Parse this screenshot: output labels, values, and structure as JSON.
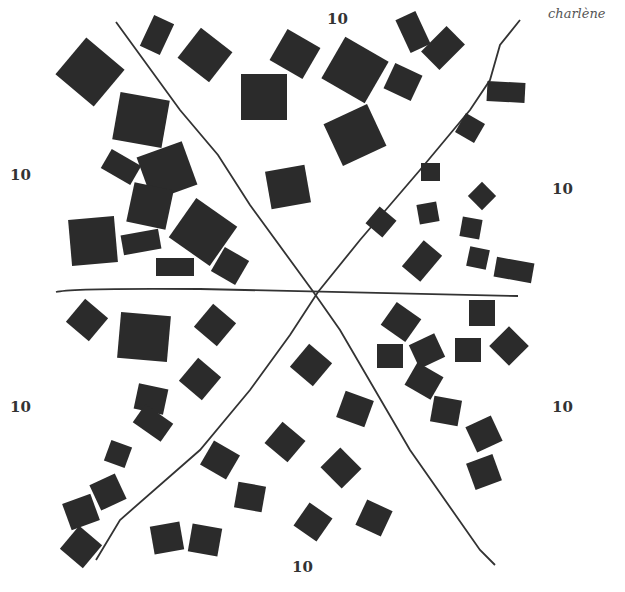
{
  "signature": "charlène",
  "labels": [
    {
      "text": "10",
      "x": 327,
      "y": 10,
      "sector": "top"
    },
    {
      "text": "10",
      "x": 10,
      "y": 166,
      "sector": "upper-left"
    },
    {
      "text": "10",
      "x": 552,
      "y": 180,
      "sector": "upper-right"
    },
    {
      "text": "10",
      "x": 10,
      "y": 398,
      "sector": "lower-left"
    },
    {
      "text": "10",
      "x": 552,
      "y": 398,
      "sector": "lower-right"
    },
    {
      "text": "10",
      "x": 292,
      "y": 558,
      "sector": "bottom"
    }
  ],
  "lines": [
    {
      "d": "M116 22 L180 110 L218 155 L250 205 L312 290 L340 330 L410 450 L480 550 L495 565"
    },
    {
      "d": "M520 20 L500 45 L490 80 L470 110 L420 170 L360 240 L318 292 L290 335 L250 390 L200 450 L120 520 L96 560"
    },
    {
      "d": "M56 292 Q70 288 200 289 L518 296"
    }
  ],
  "squares": [
    {
      "x": 65,
      "y": 48,
      "w": 50,
      "h": 48,
      "r": 40
    },
    {
      "x": 146,
      "y": 18,
      "w": 22,
      "h": 34,
      "r": 25
    },
    {
      "x": 185,
      "y": 36,
      "w": 40,
      "h": 38,
      "r": 38
    },
    {
      "x": 241,
      "y": 74,
      "w": 46,
      "h": 46,
      "r": 0
    },
    {
      "x": 276,
      "y": 36,
      "w": 38,
      "h": 36,
      "r": 30
    },
    {
      "x": 116,
      "y": 96,
      "w": 50,
      "h": 48,
      "r": 10
    },
    {
      "x": 104,
      "y": 156,
      "w": 34,
      "h": 22,
      "r": 30
    },
    {
      "x": 143,
      "y": 148,
      "w": 48,
      "h": 46,
      "r": -20
    },
    {
      "x": 130,
      "y": 186,
      "w": 40,
      "h": 40,
      "r": 12
    },
    {
      "x": 70,
      "y": 218,
      "w": 46,
      "h": 46,
      "r": -5
    },
    {
      "x": 122,
      "y": 232,
      "w": 38,
      "h": 20,
      "r": -10
    },
    {
      "x": 178,
      "y": 208,
      "w": 50,
      "h": 48,
      "r": 35
    },
    {
      "x": 156,
      "y": 258,
      "w": 38,
      "h": 18,
      "r": 0
    },
    {
      "x": 216,
      "y": 252,
      "w": 28,
      "h": 28,
      "r": 30
    },
    {
      "x": 268,
      "y": 168,
      "w": 40,
      "h": 38,
      "r": -10
    },
    {
      "x": 330,
      "y": 46,
      "w": 50,
      "h": 48,
      "r": 30
    },
    {
      "x": 331,
      "y": 112,
      "w": 48,
      "h": 46,
      "r": -25
    },
    {
      "x": 388,
      "y": 68,
      "w": 30,
      "h": 28,
      "r": 25
    },
    {
      "x": 402,
      "y": 14,
      "w": 22,
      "h": 36,
      "r": -25
    },
    {
      "x": 430,
      "y": 30,
      "w": 26,
      "h": 36,
      "r": 45
    },
    {
      "x": 487,
      "y": 82,
      "w": 38,
      "h": 20,
      "r": 3
    },
    {
      "x": 459,
      "y": 117,
      "w": 22,
      "h": 22,
      "r": 30
    },
    {
      "x": 421,
      "y": 163,
      "w": 19,
      "h": 18,
      "r": 0
    },
    {
      "x": 472,
      "y": 186,
      "w": 20,
      "h": 20,
      "r": 45
    },
    {
      "x": 370,
      "y": 211,
      "w": 22,
      "h": 22,
      "r": 40
    },
    {
      "x": 418,
      "y": 203,
      "w": 20,
      "h": 20,
      "r": -10
    },
    {
      "x": 461,
      "y": 218,
      "w": 20,
      "h": 20,
      "r": 10
    },
    {
      "x": 410,
      "y": 244,
      "w": 24,
      "h": 34,
      "r": 40
    },
    {
      "x": 468,
      "y": 248,
      "w": 20,
      "h": 20,
      "r": 12
    },
    {
      "x": 495,
      "y": 260,
      "w": 38,
      "h": 20,
      "r": 10
    },
    {
      "x": 72,
      "y": 305,
      "w": 30,
      "h": 30,
      "r": 40
    },
    {
      "x": 119,
      "y": 314,
      "w": 50,
      "h": 46,
      "r": 5
    },
    {
      "x": 200,
      "y": 310,
      "w": 30,
      "h": 30,
      "r": 40
    },
    {
      "x": 185,
      "y": 364,
      "w": 30,
      "h": 30,
      "r": 40
    },
    {
      "x": 136,
      "y": 386,
      "w": 30,
      "h": 26,
      "r": 12
    },
    {
      "x": 136,
      "y": 412,
      "w": 34,
      "h": 22,
      "r": 35
    },
    {
      "x": 107,
      "y": 443,
      "w": 22,
      "h": 22,
      "r": 20
    },
    {
      "x": 94,
      "y": 478,
      "w": 28,
      "h": 28,
      "r": -25
    },
    {
      "x": 66,
      "y": 498,
      "w": 30,
      "h": 28,
      "r": -20
    },
    {
      "x": 66,
      "y": 532,
      "w": 30,
      "h": 30,
      "r": 40
    },
    {
      "x": 152,
      "y": 524,
      "w": 30,
      "h": 28,
      "r": -10
    },
    {
      "x": 190,
      "y": 526,
      "w": 30,
      "h": 28,
      "r": 10
    },
    {
      "x": 236,
      "y": 484,
      "w": 28,
      "h": 26,
      "r": 10
    },
    {
      "x": 205,
      "y": 446,
      "w": 30,
      "h": 28,
      "r": 30
    },
    {
      "x": 270,
      "y": 428,
      "w": 30,
      "h": 28,
      "r": 40
    },
    {
      "x": 296,
      "y": 350,
      "w": 30,
      "h": 30,
      "r": 40
    },
    {
      "x": 340,
      "y": 395,
      "w": 30,
      "h": 28,
      "r": 20
    },
    {
      "x": 326,
      "y": 454,
      "w": 30,
      "h": 28,
      "r": 45
    },
    {
      "x": 299,
      "y": 508,
      "w": 28,
      "h": 28,
      "r": 35
    },
    {
      "x": 360,
      "y": 504,
      "w": 28,
      "h": 28,
      "r": 25
    },
    {
      "x": 386,
      "y": 308,
      "w": 30,
      "h": 28,
      "r": 35
    },
    {
      "x": 377,
      "y": 344,
      "w": 26,
      "h": 24,
      "r": 0
    },
    {
      "x": 413,
      "y": 338,
      "w": 28,
      "h": 26,
      "r": -25
    },
    {
      "x": 409,
      "y": 368,
      "w": 30,
      "h": 26,
      "r": 30
    },
    {
      "x": 432,
      "y": 398,
      "w": 28,
      "h": 26,
      "r": 10
    },
    {
      "x": 455,
      "y": 338,
      "w": 26,
      "h": 24,
      "r": 0
    },
    {
      "x": 469,
      "y": 300,
      "w": 26,
      "h": 26,
      "r": 0
    },
    {
      "x": 495,
      "y": 332,
      "w": 28,
      "h": 28,
      "r": 45
    },
    {
      "x": 470,
      "y": 420,
      "w": 28,
      "h": 28,
      "r": -25
    },
    {
      "x": 470,
      "y": 458,
      "w": 28,
      "h": 28,
      "r": -20
    }
  ]
}
